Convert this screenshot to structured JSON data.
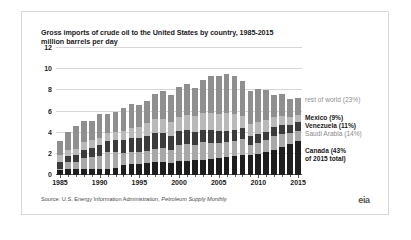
{
  "figure": {
    "title": "Gross imports of crude oil to the United States by country, 1985-2015",
    "subtitle": "million barrels per day",
    "source": "Source: U.S. Energy Information Administration, ",
    "source_italic": "Petroleum Supply Monthly",
    "logo_text": "eia"
  },
  "legend": {
    "rest_of_world": "rest of world (23%)",
    "mexico": "Mexico (9%)",
    "venezuela": "Venezuela (11%)",
    "saudi_arabia": "Saudi Arabia (14%)",
    "canada": "Canada (43%",
    "canada_line2": "of 2015 total)"
  },
  "colors": {
    "rest_of_world": "#8f8f8f",
    "mexico": "#b9b9b9",
    "venezuela": "#3b3b3b",
    "saudi_arabia": "#a8a8a8",
    "canada": "#1e1e1e",
    "gridline": "#d7d7d7",
    "axis": "#5a5a5a",
    "text": "#1a1a1a",
    "muted_text": "#8a8a8a",
    "panel_border": "#d8d8d8",
    "background": "#ffffff"
  },
  "chart_data": {
    "type": "bar",
    "stacked": true,
    "title": "Gross imports of crude oil to the United States by country, 1985-2015",
    "subtitle": "million barrels per day",
    "xlabel": "",
    "ylabel": "million barrels per day",
    "ylim": [
      0,
      12
    ],
    "yticks": [
      0,
      2,
      4,
      6,
      8,
      10,
      12
    ],
    "grid": true,
    "legend_position": "right",
    "categories": [
      1985,
      1986,
      1987,
      1988,
      1989,
      1990,
      1991,
      1992,
      1993,
      1994,
      1995,
      1996,
      1997,
      1998,
      1999,
      2000,
      2001,
      2002,
      2003,
      2004,
      2005,
      2006,
      2007,
      2008,
      2009,
      2010,
      2011,
      2012,
      2013,
      2014,
      2015
    ],
    "xtick_labels": [
      "1985",
      "1990",
      "1995",
      "2000",
      "2005",
      "2010",
      "2015"
    ],
    "xtick_years": [
      1985,
      1990,
      1995,
      2000,
      2005,
      2010,
      2015
    ],
    "series": [
      {
        "name": "Canada (43% of 2015 total)",
        "color": "#1e1e1e",
        "values": [
          0.5,
          0.6,
          0.6,
          0.6,
          0.6,
          0.6,
          0.6,
          0.7,
          0.9,
          1.0,
          1.0,
          1.1,
          1.2,
          1.2,
          1.1,
          1.3,
          1.3,
          1.4,
          1.4,
          1.5,
          1.6,
          1.7,
          1.8,
          1.9,
          1.9,
          2.0,
          2.2,
          2.4,
          2.6,
          2.9,
          3.2
        ]
      },
      {
        "name": "Saudi Arabia (14%)",
        "color": "#a8a8a8",
        "values": [
          0.1,
          0.6,
          0.6,
          1.0,
          1.1,
          1.2,
          1.6,
          1.5,
          1.2,
          1.2,
          1.2,
          1.2,
          1.3,
          1.4,
          1.3,
          1.5,
          1.6,
          1.4,
          1.7,
          1.5,
          1.4,
          1.4,
          1.4,
          1.5,
          0.9,
          1.0,
          1.1,
          1.3,
          1.3,
          1.1,
          1.0
        ]
      },
      {
        "name": "Venezuela (11%)",
        "color": "#3b3b3b",
        "values": [
          0.6,
          0.6,
          0.7,
          0.8,
          0.9,
          1.0,
          1.0,
          1.1,
          1.2,
          1.3,
          1.3,
          1.4,
          1.5,
          1.4,
          1.3,
          1.4,
          1.4,
          1.3,
          1.2,
          1.3,
          1.2,
          1.1,
          1.1,
          1.0,
          0.9,
          0.9,
          0.8,
          0.8,
          0.8,
          0.7,
          0.8
        ]
      },
      {
        "name": "Mexico (9%)",
        "color": "#b9b9b9",
        "values": [
          0.7,
          0.6,
          0.6,
          0.7,
          0.7,
          0.7,
          0.8,
          0.8,
          0.9,
          0.9,
          1.0,
          1.2,
          1.3,
          1.3,
          1.3,
          1.3,
          1.4,
          1.5,
          1.6,
          1.6,
          1.6,
          1.7,
          1.5,
          1.2,
          1.1,
          1.1,
          1.1,
          1.0,
          0.9,
          0.8,
          0.7
        ]
      },
      {
        "name": "rest of world (23%)",
        "color": "#8f8f8f",
        "values": [
          1.3,
          1.7,
          2.1,
          2.0,
          1.8,
          2.3,
          1.8,
          1.9,
          2.1,
          2.3,
          2.1,
          2.1,
          2.4,
          2.6,
          2.6,
          2.8,
          2.9,
          2.6,
          3.1,
          3.5,
          3.6,
          3.6,
          3.6,
          3.3,
          3.1,
          3.1,
          2.8,
          2.1,
          2.1,
          1.7,
          1.6
        ]
      }
    ]
  }
}
